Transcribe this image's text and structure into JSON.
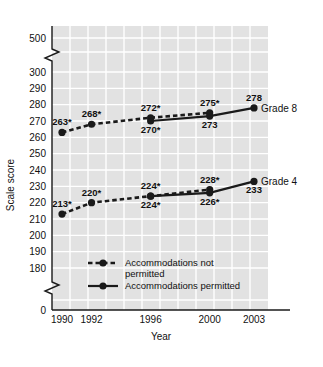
{
  "chart_data": {
    "type": "line",
    "title": "",
    "xlabel": "Year",
    "ylabel": "Scale score",
    "x": [
      1990,
      1992,
      1996,
      2000,
      2003
    ],
    "xtick_labels": [
      "1990",
      "1992",
      "1996",
      "2000",
      "2003"
    ],
    "ytick_labels": [
      "500",
      "300",
      "290",
      "280",
      "270",
      "260",
      "250",
      "240",
      "230",
      "220",
      "210",
      "200",
      "190",
      "180",
      "0"
    ],
    "ylim": [
      180,
      300
    ],
    "y_axis_breaks": [
      "between 300 and 500",
      "between 180 and 0"
    ],
    "grid": true,
    "legend_position": "inside-lower-left",
    "series": [
      {
        "name": "Grade 8 - Accommodations not permitted",
        "grade": "Grade 8",
        "style": "dashed",
        "x": [
          1990,
          1992,
          1996,
          2000
        ],
        "values": [
          263,
          268,
          272,
          275
        ],
        "labels": [
          "263*",
          "268*",
          "272*",
          "275*"
        ],
        "label_positions": [
          "above",
          "above",
          "above",
          "above"
        ]
      },
      {
        "name": "Grade 8 - Accommodations permitted",
        "grade": "Grade 8",
        "style": "solid",
        "x": [
          1996,
          2000,
          2003
        ],
        "values": [
          270,
          273,
          278
        ],
        "labels": [
          "270*",
          "273",
          "278"
        ],
        "label_positions": [
          "below",
          "below",
          "above"
        ]
      },
      {
        "name": "Grade 4 - Accommodations not permitted",
        "grade": "Grade 4",
        "style": "dashed",
        "x": [
          1990,
          1992,
          1996,
          2000
        ],
        "values": [
          213,
          220,
          224,
          228
        ],
        "labels": [
          "213*",
          "220*",
          "224*",
          "228*"
        ],
        "label_positions": [
          "above",
          "above",
          "above",
          "above"
        ]
      },
      {
        "name": "Grade 4 - Accommodations permitted",
        "grade": "Grade 4",
        "style": "solid",
        "x": [
          1996,
          2000,
          2003
        ],
        "values": [
          224,
          226,
          233
        ],
        "labels": [
          "224*",
          "226*",
          "233"
        ],
        "label_positions": [
          "below",
          "below",
          "below"
        ]
      }
    ],
    "series_end_labels": [
      "Grade 8",
      "Grade 4"
    ],
    "legend": [
      {
        "label_line1": "Accommodations not",
        "label_line2": "permitted",
        "style": "dashed"
      },
      {
        "label_line1": "Accommodations permitted",
        "label_line2": "",
        "style": "solid"
      }
    ],
    "colors": {
      "plot_background": "#e2e2e2",
      "gridline": "#ffffff",
      "axis": "#1a1a1a",
      "marker": "#1a1a1a",
      "line": "#1a1a1a",
      "text": "#111111",
      "page_background": "#ffffff"
    }
  }
}
